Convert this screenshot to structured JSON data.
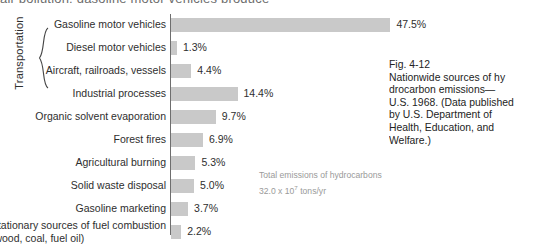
{
  "top_clipped_text": "air pollution; gasoline motor vehicles produce",
  "group": {
    "label": "Transportation",
    "brace_icon": "curly-brace-icon"
  },
  "annotation": {
    "line1": "Total emissions of hydrocarbons",
    "line2_prefix": "32.0 x 10",
    "line2_exponent": "7",
    "line2_suffix": " tons/yr"
  },
  "caption": {
    "fig_number": "Fig. 4-12",
    "lines": [
      "Nationwide sources of hy",
      "drocarbon          emissions—",
      "U.S. 1968. (Data published",
      "by  U.S.  Department  of",
      "Health,  Education,  and",
      "Welfare.)"
    ]
  },
  "colors": {
    "bar_fill": "#c9c9c9",
    "axis": "#6e6e6e",
    "text": "#2e2e2e",
    "annotation_text": "#9a9a9a"
  },
  "chart_data": {
    "type": "bar",
    "orientation": "horizontal",
    "title": "Nationwide sources of hydrocarbon emissions—U.S. 1968",
    "xlabel": "",
    "ylabel": "",
    "value_unit": "%",
    "total_emissions": "32.0 x 10^7 tons/yr",
    "grid": false,
    "legend": false,
    "xlim": [
      0,
      50
    ],
    "categories": [
      "Gasoline motor vehicles",
      "Diesel motor vehicles",
      "Aircraft, railroads, vessels",
      "Industrial processes",
      "Organic solvent evaporation",
      "Forest fires",
      "Agricultural burning",
      "Solid waste disposal",
      "Gasoline marketing",
      "Stationary sources of fuel combustion (wood, coal, fuel oil)"
    ],
    "values": [
      47.5,
      1.3,
      4.4,
      14.4,
      9.7,
      6.9,
      5.3,
      5.0,
      3.7,
      2.2
    ],
    "value_labels": [
      "47.5%",
      "1.3%",
      "4.4%",
      "14.4%",
      "9.7%",
      "6.9%",
      "5.3%",
      "5.0%",
      "3.7%",
      "2.2%"
    ],
    "rows": [
      {
        "label": "Gasoline motor vehicles",
        "value": 47.5,
        "label_text": "47.5%",
        "grouped": true
      },
      {
        "label": "Diesel motor vehicles",
        "value": 1.3,
        "label_text": "1.3%",
        "grouped": true
      },
      {
        "label": "Aircraft, railroads, vessels",
        "value": 4.4,
        "label_text": "4.4%",
        "grouped": true
      },
      {
        "label": "Industrial processes",
        "value": 14.4,
        "label_text": "14.4%",
        "grouped": false
      },
      {
        "label": "Organic solvent evaporation",
        "value": 9.7,
        "label_text": "9.7%",
        "grouped": false
      },
      {
        "label": "Forest fires",
        "value": 6.9,
        "label_text": "6.9%",
        "grouped": false
      },
      {
        "label": "Agricultural burning",
        "value": 5.3,
        "label_text": "5.3%",
        "grouped": false
      },
      {
        "label": "Solid waste disposal",
        "value": 5.0,
        "label_text": "5.0%",
        "grouped": false
      },
      {
        "label": "Gasoline marketing",
        "value": 3.7,
        "label_text": "3.7%",
        "grouped": false
      },
      {
        "label": "Stationary sources of fuel combustion",
        "label2": "(wood, coal, fuel oil)",
        "value": 2.2,
        "label_text": "2.2%",
        "grouped": false
      }
    ]
  }
}
